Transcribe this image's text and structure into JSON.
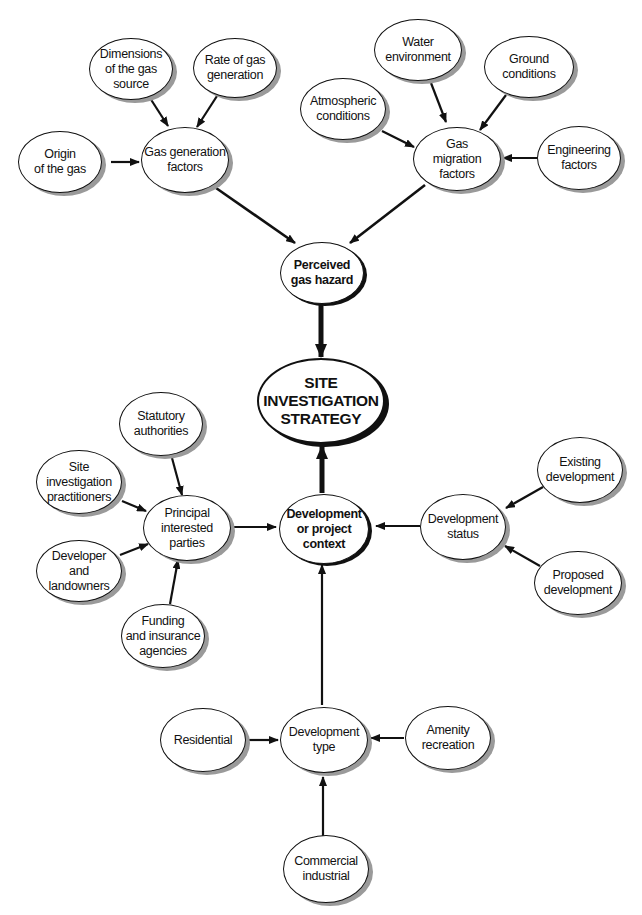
{
  "diagram": {
    "nodes": {
      "dimensions": "Dimensions\nof the gas\nsource",
      "rate": "Rate of gas\ngeneration",
      "origin": "Origin\nof the gas",
      "gas_gen": "Gas generation\nfactors",
      "water": "Water\nenvironment",
      "ground": "Ground\nconditions",
      "atmospheric": "Atmospheric\nconditions",
      "gas_mig": "Gas\nmigration\nfactors",
      "engineering": "Engineering\nfactors",
      "perceived": "Perceived\ngas hazard",
      "strategy": "SITE\nINVESTIGATION\nSTRATEGY",
      "statutory": "Statutory\nauthorities",
      "si_practitioners": "Site\ninvestigation\npractitioners",
      "principal": "Principal\ninterested\nparties",
      "developer": "Developer\nand landowners",
      "funding": "Funding\nand insurance\nagencies",
      "context": "Development\nor project\ncontext",
      "dev_status": "Development\nstatus",
      "existing": "Existing\ndevelopment",
      "proposed": "Proposed\ndevelopment",
      "residential": "Residential",
      "dev_type": "Development\ntype",
      "amenity": "Amenity\nrecreation",
      "commercial": "Commercial\nindustrial"
    },
    "edges": [
      [
        "dimensions",
        "gas_gen"
      ],
      [
        "rate",
        "gas_gen"
      ],
      [
        "origin",
        "gas_gen"
      ],
      [
        "water",
        "gas_mig"
      ],
      [
        "ground",
        "gas_mig"
      ],
      [
        "atmospheric",
        "gas_mig"
      ],
      [
        "engineering",
        "gas_mig"
      ],
      [
        "gas_gen",
        "perceived"
      ],
      [
        "gas_mig",
        "perceived"
      ],
      [
        "perceived",
        "strategy"
      ],
      [
        "context",
        "strategy"
      ],
      [
        "statutory",
        "principal"
      ],
      [
        "si_practitioners",
        "principal"
      ],
      [
        "developer",
        "principal"
      ],
      [
        "funding",
        "principal"
      ],
      [
        "principal",
        "context"
      ],
      [
        "dev_status",
        "context"
      ],
      [
        "existing",
        "dev_status"
      ],
      [
        "proposed",
        "dev_status"
      ],
      [
        "dev_type",
        "context"
      ],
      [
        "residential",
        "dev_type"
      ],
      [
        "amenity",
        "dev_type"
      ],
      [
        "commercial",
        "dev_type"
      ]
    ]
  }
}
